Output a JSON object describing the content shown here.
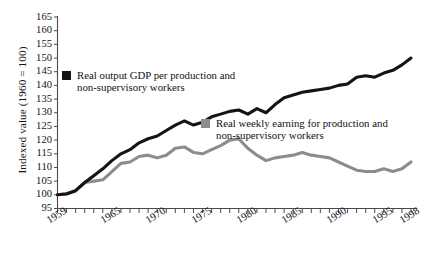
{
  "chart_data": {
    "type": "line",
    "title": "",
    "xlabel": "",
    "ylabel": "Indexed value (1960 = 100)",
    "xlim": [
      1959,
      1998
    ],
    "ylim": [
      95,
      165
    ],
    "ytick_step": 5,
    "yticks": [
      95,
      100,
      105,
      110,
      115,
      120,
      125,
      130,
      135,
      140,
      145,
      150,
      155,
      160,
      165
    ],
    "xticks_labeled": [
      1959,
      1965,
      1970,
      1975,
      1980,
      1985,
      1990,
      1995,
      1998
    ],
    "xticks_all": [
      1959,
      1960,
      1961,
      1962,
      1963,
      1964,
      1965,
      1966,
      1967,
      1968,
      1969,
      1970,
      1971,
      1972,
      1973,
      1974,
      1975,
      1976,
      1977,
      1978,
      1979,
      1980,
      1981,
      1982,
      1983,
      1984,
      1985,
      1986,
      1987,
      1988,
      1989,
      1990,
      1991,
      1992,
      1993,
      1994,
      1995,
      1996,
      1997,
      1998
    ],
    "grid": false,
    "legend_position": "inside",
    "x": [
      1959,
      1960,
      1961,
      1962,
      1963,
      1964,
      1965,
      1966,
      1967,
      1968,
      1969,
      1970,
      1971,
      1972,
      1973,
      1974,
      1975,
      1976,
      1977,
      1978,
      1979,
      1980,
      1981,
      1982,
      1983,
      1984,
      1985,
      1986,
      1987,
      1988,
      1989,
      1990,
      1991,
      1992,
      1993,
      1994,
      1995,
      1996,
      1997,
      1998
    ],
    "series": [
      {
        "name": "Real output GDP per production and non-supervisory workers",
        "color": "#141414",
        "marker": "black-square",
        "values": [
          100.0,
          100.3,
          101.5,
          104.5,
          107.0,
          109.5,
          112.5,
          115.0,
          116.5,
          119.0,
          120.5,
          121.5,
          123.5,
          125.5,
          127.0,
          125.5,
          126.5,
          128.5,
          129.5,
          130.5,
          131.0,
          129.5,
          131.5,
          130.0,
          133.0,
          135.5,
          136.5,
          137.5,
          138.0,
          138.5,
          139.0,
          140.0,
          140.5,
          143.0,
          143.5,
          143.0,
          144.5,
          145.5,
          147.5,
          150.0
        ]
      },
      {
        "name": "Real weekly earning for production and non-supervisory workers",
        "color": "#8c8c8c",
        "marker": "gray-square",
        "values": [
          100.0,
          100.5,
          101.5,
          104.5,
          105.0,
          105.5,
          108.5,
          111.5,
          112.0,
          114.0,
          114.5,
          113.5,
          114.5,
          117.0,
          117.5,
          115.5,
          115.0,
          116.5,
          118.0,
          120.0,
          120.5,
          117.0,
          114.5,
          112.5,
          113.5,
          114.0,
          114.5,
          115.5,
          114.5,
          114.0,
          113.5,
          112.0,
          110.5,
          109.0,
          108.5,
          108.5,
          109.5,
          108.5,
          109.5,
          112.0
        ]
      }
    ],
    "legend_entries": [
      {
        "id": "gdp",
        "color": "#141414",
        "line1": "Real output GDP per production and",
        "line2": "non-supervisory workers"
      },
      {
        "id": "wage",
        "color": "#8c8c8c",
        "line1": "Real weekly earning for production and",
        "line2": "non-supervisory workers"
      }
    ]
  },
  "axis": {
    "y_title": "Indexed value (1960 = 100)",
    "y_tick_labels": [
      "165",
      "160",
      "155",
      "150",
      "145",
      "140",
      "135",
      "130",
      "125",
      "120",
      "115",
      "110",
      "105",
      "100",
      "95"
    ],
    "x_tick_labels": [
      "1959",
      "1965",
      "1970",
      "1975",
      "1980",
      "1985",
      "1990",
      "1995",
      "1998"
    ]
  },
  "colors": {
    "background": "#ffffff",
    "axis": "#4a4a4a",
    "series_gdp": "#141414",
    "series_wage": "#8c8c8c",
    "text": "#141414"
  }
}
